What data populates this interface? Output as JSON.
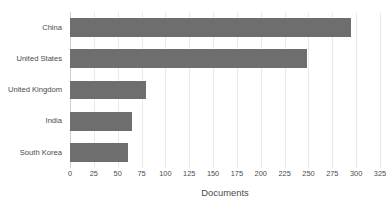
{
  "chart_data": {
    "type": "bar",
    "orientation": "horizontal",
    "title": "",
    "subtitle": "",
    "xlabel": "Documents",
    "ylabel": "",
    "categories": [
      "China",
      "United States",
      "United Kingdom",
      "India",
      "South Korea"
    ],
    "values": [
      295,
      248,
      80,
      65,
      61
    ],
    "series": [
      {
        "name": "Documents",
        "values": [
          295,
          248,
          80,
          65,
          61
        ]
      }
    ],
    "xlim": [
      0,
      325
    ],
    "xticks": [
      0,
      25,
      50,
      75,
      100,
      125,
      150,
      175,
      200,
      225,
      250,
      275,
      300,
      325
    ],
    "xtick_labels": [
      "0",
      "25",
      "50",
      "75",
      "100",
      "125",
      "150",
      "175",
      "200",
      "225",
      "250",
      "275",
      "300",
      "325"
    ],
    "grid": "vertical",
    "legend": "none",
    "bar_color": "#6e6e6e",
    "grid_color": "#e9e9e9",
    "axis_color": "#d0d0d0",
    "text_color": "#4a4a4a",
    "background_color": "#ffffff"
  }
}
